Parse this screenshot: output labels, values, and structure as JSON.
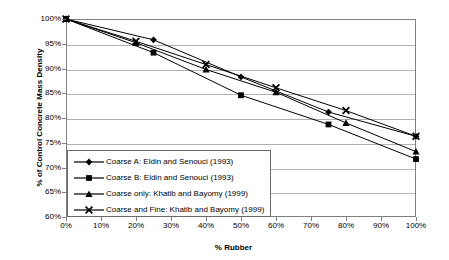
{
  "chart_data": {
    "type": "line",
    "title": "",
    "xlabel": "% Rubber",
    "ylabel": "% of Control Concrete Mass Density",
    "xlim": [
      0,
      100
    ],
    "ylim": [
      60,
      100
    ],
    "xticks": [
      "0%",
      "10%",
      "20%",
      "30%",
      "40%",
      "50%",
      "60%",
      "70%",
      "80%",
      "90%",
      "100%"
    ],
    "yticks": [
      "60%",
      "65%",
      "70%",
      "75%",
      "80%",
      "85%",
      "90%",
      "95%",
      "100%"
    ],
    "grid": "horizontal",
    "legend_position": "inside-bottom-left",
    "series": [
      {
        "name": "Coarse A: Eldin and Senouci (1993)",
        "marker": "diamond",
        "color": "#000000",
        "x": [
          0,
          25,
          50,
          75,
          100
        ],
        "y": [
          100,
          95.8,
          88.3,
          81.2,
          76.3
        ]
      },
      {
        "name": "Coarse B: Eldin and Senouci (1993)",
        "marker": "square",
        "color": "#000000",
        "x": [
          0,
          25,
          50,
          75,
          100
        ],
        "y": [
          100,
          93.2,
          84.6,
          78.7,
          71.7
        ]
      },
      {
        "name": "Coarse only: Khatib and Bayomy (1999)",
        "marker": "triangle",
        "color": "#000000",
        "x": [
          0,
          20,
          40,
          60,
          80,
          100
        ],
        "y": [
          100,
          95.2,
          89.8,
          85.2,
          79.0,
          73.2
        ]
      },
      {
        "name": "Coarse and Fine: Khatib and Bayomy (1999)",
        "marker": "cross",
        "color": "#000000",
        "x": [
          0,
          20,
          40,
          60,
          80,
          100
        ],
        "y": [
          100,
          95.5,
          90.8,
          86.1,
          81.5,
          76.3
        ]
      }
    ]
  },
  "legend": {
    "items": [
      "Coarse A: Eldin and Senouci (1993)",
      "Coarse B: Eldin and Senouci (1993)",
      "Coarse only: Khatib and Bayomy (1999)",
      "Coarse and Fine: Khatib and Bayomy (1999)"
    ]
  }
}
